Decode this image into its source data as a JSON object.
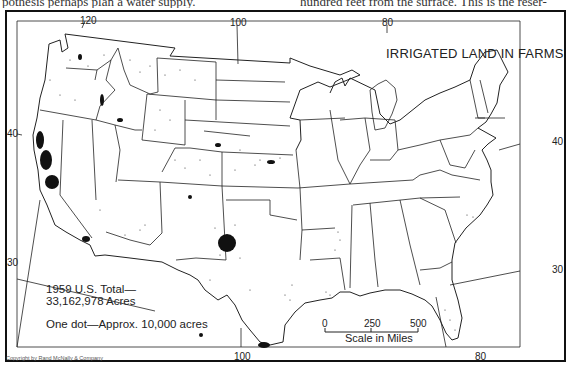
{
  "header_text": {
    "left": "pothesis perhaps plan a water supply.",
    "right": "hundred feet from the surface. This is the reser-"
  },
  "map": {
    "title": "IRRIGATED LAND IN FARMS",
    "total_label_line1": "1959 U.S. Total—",
    "total_label_line2": "33,162,978 Acres",
    "dot_legend": "One dot—Approx. 10,000 acres",
    "copyright": "Copyright by Rand McNally & Company",
    "longitude_ticks": [
      {
        "label": "120",
        "position": "top"
      },
      {
        "label": "100",
        "position": "top"
      },
      {
        "label": "80",
        "position": "top"
      },
      {
        "label": "100",
        "position": "bottom"
      },
      {
        "label": "80",
        "position": "bottom"
      }
    ],
    "latitude_ticks": [
      {
        "label": "40",
        "side": "left"
      },
      {
        "label": "30",
        "side": "left"
      },
      {
        "label": "40",
        "side": "right"
      },
      {
        "label": "30",
        "side": "right"
      }
    ],
    "scale": {
      "title": "Scale in Miles",
      "marks": [
        "0",
        "250",
        "500"
      ]
    },
    "colors": {
      "ink": "#111111",
      "paper": "#ffffff"
    },
    "dense_clusters": [
      "California Central Valley",
      "Texas High Plains",
      "Lower Rio Grande Valley",
      "Imperial Valley",
      "Snake River Plain",
      "Platte River Nebraska",
      "Arkansas Delta",
      "Louisiana rice belt"
    ]
  }
}
